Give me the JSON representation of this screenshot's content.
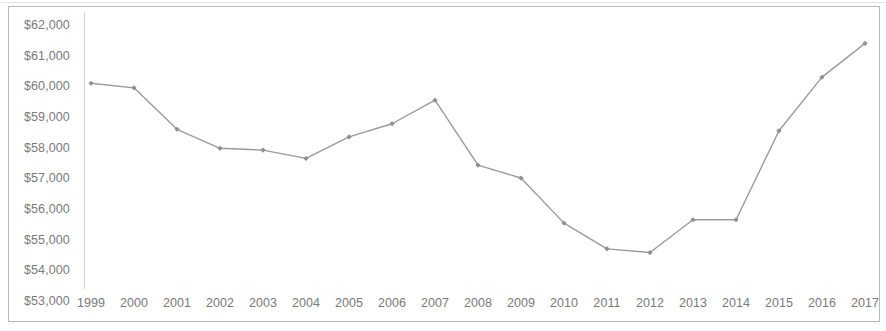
{
  "chart_data": {
    "type": "line",
    "title": "",
    "subtitle": "",
    "xlabel": "",
    "ylabel": "",
    "categories": [
      "1999",
      "2000",
      "2001",
      "2002",
      "2003",
      "2004",
      "2005",
      "2006",
      "2007",
      "2008",
      "2009",
      "2010",
      "2011",
      "2012",
      "2013",
      "2014",
      "2015",
      "2016",
      "2017"
    ],
    "x": [
      1999,
      2000,
      2001,
      2002,
      2003,
      2004,
      2005,
      2006,
      2007,
      2008,
      2009,
      2010,
      2011,
      2012,
      2013,
      2014,
      2015,
      2016,
      2017
    ],
    "values": [
      60100,
      59950,
      58600,
      57980,
      57920,
      57650,
      58350,
      58780,
      59550,
      57430,
      57010,
      55540,
      54700,
      54580,
      55650,
      55650,
      58550,
      60300,
      61400
    ],
    "series": [
      {
        "name": "Median household income",
        "values": [
          60100,
          59950,
          58600,
          57980,
          57920,
          57650,
          58350,
          58780,
          59550,
          57430,
          57010,
          55540,
          54700,
          54580,
          55650,
          55650,
          58550,
          60300,
          61400
        ]
      }
    ],
    "ylim": [
      53000,
      62000
    ],
    "ytick_values": [
      62000,
      61000,
      60000,
      59000,
      58000,
      57000,
      56000,
      55000,
      54000,
      53000
    ],
    "ytick_labels": [
      "$62,000",
      "$61,000",
      "$60,000",
      "$59,000",
      "$58,000",
      "$57,000",
      "$56,000",
      "$55,000",
      "$54,000",
      "$53,000"
    ],
    "xtick_labels": [
      "1999",
      "2000",
      "2001",
      "2002",
      "2003",
      "2004",
      "2005",
      "2006",
      "2007",
      "2008",
      "2009",
      "2010",
      "2011",
      "2012",
      "2013",
      "2014",
      "2015",
      "2016",
      "2017"
    ],
    "grid": false,
    "legend": "none",
    "line_color": "#9a9a9a",
    "marker_color": "#8f8f8f",
    "marker_shape": "diamond",
    "axis_color": "#d4d4d4",
    "text_color": "#7a7a7a",
    "border_color": "#b9b9b9",
    "background_color": "#ffffff",
    "annotations": []
  }
}
